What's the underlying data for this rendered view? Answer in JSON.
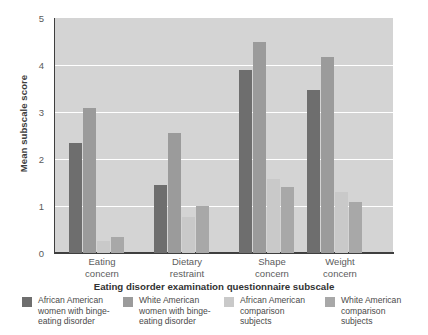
{
  "chart_data": {
    "type": "bar",
    "title": "",
    "xlabel": "Eating disorder examination questionnaire subscale",
    "ylabel": "Mean subscale score",
    "ylim": [
      0,
      5
    ],
    "yticks": [
      "0",
      "1",
      "2",
      "3",
      "4",
      "5"
    ],
    "grid": true,
    "legend_position": "bottom",
    "categories": [
      "Eating concern",
      "Dietary restraint",
      "Shape concern",
      "Weight concern"
    ],
    "category_lines": [
      [
        "Eating",
        "concern"
      ],
      [
        "Dietary",
        "restraint"
      ],
      [
        "Shape",
        "concern"
      ],
      [
        "Weight",
        "concern"
      ]
    ],
    "series": [
      {
        "name": "African American women with binge-eating disorder",
        "name_lines": [
          "African American",
          "women with binge-",
          "eating disorder"
        ],
        "color": "#6e6e6e",
        "values": [
          2.35,
          1.45,
          3.9,
          3.47
        ]
      },
      {
        "name": "White American women with binge-eating disorder",
        "name_lines": [
          "White American",
          "women with binge-",
          "eating disorder"
        ],
        "color": "#9b9b9b",
        "values": [
          3.08,
          2.55,
          4.5,
          4.17
        ]
      },
      {
        "name": "African American comparison subjects",
        "name_lines": [
          "African American",
          "comparison",
          "subjects"
        ],
        "color": "#c9c9c9",
        "values": [
          0.25,
          0.77,
          1.57,
          1.3
        ]
      },
      {
        "name": "White American comparison subjects",
        "name_lines": [
          "White American",
          "comparison",
          "subjects"
        ],
        "color": "#a8a8a8",
        "values": [
          0.35,
          1.0,
          1.4,
          1.08
        ]
      }
    ]
  },
  "plot": {
    "background_color": "#d4d4d4",
    "gridline_color": "#ffffff",
    "axis_color": "#3f3f3f"
  }
}
